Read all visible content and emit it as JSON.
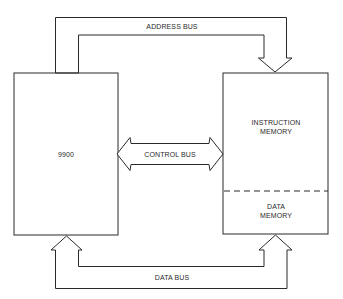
{
  "diagram": {
    "type": "block-diagram",
    "nodes": [
      {
        "id": "cpu",
        "label": "9900"
      },
      {
        "id": "memory",
        "sections": [
          {
            "id": "instruction-memory",
            "label_lines": [
              "INSTRUCTION",
              "MEMORY"
            ]
          },
          {
            "id": "data-memory",
            "label_lines": [
              "DATA",
              "MEMORY"
            ]
          }
        ]
      }
    ],
    "buses": [
      {
        "id": "address-bus",
        "label": "ADDRESS BUS",
        "from": "cpu",
        "to": "memory",
        "direction": "one-way"
      },
      {
        "id": "control-bus",
        "label": "CONTROL BUS",
        "from": "cpu",
        "to": "memory",
        "direction": "two-way"
      },
      {
        "id": "data-bus",
        "label": "DATA BUS",
        "from": "memory",
        "to": "cpu",
        "direction": "two-way"
      }
    ]
  },
  "labels": {
    "cpu": "9900",
    "instruction_memory_1": "INSTRUCTION",
    "instruction_memory_2": "MEMORY",
    "data_memory_1": "DATA",
    "data_memory_2": "MEMORY",
    "address_bus": "ADDRESS BUS",
    "control_bus": "CONTROL BUS",
    "data_bus": "DATA BUS"
  },
  "colors": {
    "stroke": "#2a2a2a",
    "background": "#ffffff"
  }
}
